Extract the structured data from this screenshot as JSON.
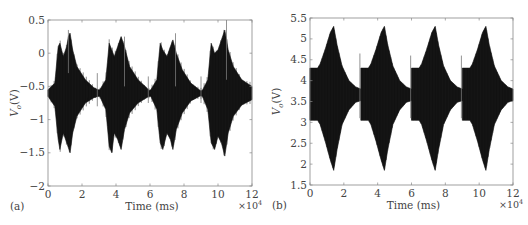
{
  "chart_data": [
    {
      "panel_label": "(a)",
      "type": "line",
      "title": "",
      "xlabel": "Time (ms)",
      "ylabel": "V_o (V)",
      "ylabel_main": "V",
      "ylabel_sub": "o",
      "ylabel_unit": "(V)",
      "x_multiplier": "×10",
      "x_multiplier_exp": "4",
      "xlim": [
        0,
        12
      ],
      "ylim": [
        -2,
        0.5
      ],
      "xticks": [
        0,
        2,
        4,
        6,
        8,
        10,
        12
      ],
      "yticks": [
        -2,
        -1.5,
        -1,
        -0.5,
        0,
        0.5
      ],
      "ytick_labels": [
        "−2",
        "−1.5",
        "−1",
        "−0.5",
        "0",
        "0.5"
      ],
      "grid": false,
      "baseline": -0.6,
      "description": "Four dense oscillation bursts with irregular jagged envelopes; baseline around -0.6 V",
      "bursts": [
        {
          "start": 0.0,
          "peak": 1.3,
          "end": 3.0,
          "max": 0.3,
          "min": -1.5
        },
        {
          "start": 3.0,
          "peak": 4.3,
          "end": 6.0,
          "max": 0.25,
          "min": -1.5
        },
        {
          "start": 6.0,
          "peak": 7.3,
          "end": 9.0,
          "max": 0.2,
          "min": -1.45
        },
        {
          "start": 9.0,
          "peak": 10.4,
          "end": 12.0,
          "max": 0.35,
          "min": -1.55
        }
      ],
      "envelope_upper": [
        [
          0,
          -0.55
        ],
        [
          0.4,
          -0.45
        ],
        [
          0.6,
          0.1
        ],
        [
          0.7,
          0.15
        ],
        [
          0.9,
          -0.05
        ],
        [
          1.1,
          0.1
        ],
        [
          1.2,
          0.25
        ],
        [
          1.3,
          0.3
        ],
        [
          1.45,
          0.05
        ],
        [
          1.7,
          -0.2
        ],
        [
          2.2,
          -0.4
        ],
        [
          2.7,
          -0.52
        ],
        [
          2.95,
          -0.55
        ],
        [
          3.05,
          -0.55
        ],
        [
          3.4,
          -0.4
        ],
        [
          3.6,
          0.15
        ],
        [
          3.75,
          0.05
        ],
        [
          3.9,
          -0.05
        ],
        [
          4.1,
          0.1
        ],
        [
          4.3,
          0.25
        ],
        [
          4.5,
          0.1
        ],
        [
          4.8,
          -0.2
        ],
        [
          5.3,
          -0.4
        ],
        [
          5.8,
          -0.52
        ],
        [
          5.95,
          -0.56
        ],
        [
          6.05,
          -0.55
        ],
        [
          6.4,
          -0.4
        ],
        [
          6.6,
          0.15
        ],
        [
          6.75,
          0.05
        ],
        [
          7.0,
          -0.05
        ],
        [
          7.2,
          0.1
        ],
        [
          7.35,
          0.2
        ],
        [
          7.55,
          0.0
        ],
        [
          7.9,
          -0.25
        ],
        [
          8.4,
          -0.45
        ],
        [
          8.9,
          -0.55
        ],
        [
          9.0,
          -0.57
        ],
        [
          9.1,
          -0.55
        ],
        [
          9.4,
          -0.4
        ],
        [
          9.6,
          0.15
        ],
        [
          9.8,
          0.0
        ],
        [
          10.0,
          0.05
        ],
        [
          10.2,
          0.2
        ],
        [
          10.4,
          0.35
        ],
        [
          10.6,
          0.05
        ],
        [
          10.9,
          -0.2
        ],
        [
          11.4,
          -0.4
        ],
        [
          12,
          -0.5
        ]
      ],
      "envelope_lower": [
        [
          0,
          -0.65
        ],
        [
          0.4,
          -0.8
        ],
        [
          0.6,
          -1.3
        ],
        [
          0.7,
          -1.45
        ],
        [
          0.9,
          -1.2
        ],
        [
          1.1,
          -1.35
        ],
        [
          1.3,
          -1.5
        ],
        [
          1.45,
          -1.2
        ],
        [
          1.7,
          -0.95
        ],
        [
          2.2,
          -0.75
        ],
        [
          2.7,
          -0.67
        ],
        [
          2.95,
          -0.65
        ],
        [
          3.05,
          -0.65
        ],
        [
          3.4,
          -0.85
        ],
        [
          3.6,
          -1.4
        ],
        [
          3.75,
          -1.5
        ],
        [
          3.9,
          -1.2
        ],
        [
          4.1,
          -1.3
        ],
        [
          4.3,
          -1.45
        ],
        [
          4.5,
          -1.15
        ],
        [
          4.8,
          -0.9
        ],
        [
          5.3,
          -0.75
        ],
        [
          5.8,
          -0.67
        ],
        [
          5.95,
          -0.65
        ],
        [
          6.05,
          -0.65
        ],
        [
          6.4,
          -0.85
        ],
        [
          6.6,
          -1.35
        ],
        [
          6.75,
          -1.45
        ],
        [
          7.0,
          -1.2
        ],
        [
          7.2,
          -1.3
        ],
        [
          7.35,
          -1.45
        ],
        [
          7.55,
          -1.15
        ],
        [
          7.9,
          -0.9
        ],
        [
          8.4,
          -0.72
        ],
        [
          8.9,
          -0.65
        ],
        [
          9.0,
          -0.64
        ],
        [
          9.1,
          -0.66
        ],
        [
          9.4,
          -0.85
        ],
        [
          9.6,
          -1.35
        ],
        [
          9.8,
          -1.45
        ],
        [
          10.0,
          -1.25
        ],
        [
          10.2,
          -1.35
        ],
        [
          10.4,
          -1.55
        ],
        [
          10.6,
          -1.2
        ],
        [
          10.9,
          -0.95
        ],
        [
          11.4,
          -0.78
        ],
        [
          12,
          -0.7
        ]
      ],
      "spikes": [
        {
          "x": 1.2,
          "y1": -0.3,
          "y2": 0.35
        },
        {
          "x": 2.9,
          "y1": -0.8,
          "y2": -0.3
        },
        {
          "x": 4.5,
          "y1": -0.5,
          "y2": 0.25
        },
        {
          "x": 5.9,
          "y1": -0.75,
          "y2": -0.35
        },
        {
          "x": 7.5,
          "y1": -0.5,
          "y2": 0.3
        },
        {
          "x": 9.0,
          "y1": -0.75,
          "y2": -0.35
        },
        {
          "x": 10.5,
          "y1": -0.4,
          "y2": 0.5
        }
      ]
    },
    {
      "panel_label": "(b)",
      "type": "line",
      "title": "",
      "xlabel": "Time (ms)",
      "ylabel": "V_o (V)",
      "ylabel_main": "V",
      "ylabel_sub": "o",
      "ylabel_unit": "(V)",
      "x_multiplier": "×10",
      "x_multiplier_exp": "4",
      "xlim": [
        0,
        12
      ],
      "ylim": [
        1.5,
        5.5
      ],
      "xticks": [
        0,
        2,
        4,
        6,
        8,
        10,
        12
      ],
      "yticks": [
        1.5,
        2,
        2.5,
        3,
        3.5,
        4,
        4.5,
        5,
        5.5
      ],
      "ytick_labels": [
        "1.5",
        "2",
        "2.5",
        "3",
        "3.5",
        "4",
        "4.5",
        "5",
        "5.5"
      ],
      "grid": false,
      "description": "Four smooth symmetric bursts peaking at ~5.3 V and ~1.85 V near t=1.4, 4.4, 7.4, 10.4 (×10^4 ms), decaying to 3.6–3.9 V band",
      "bursts": [
        {
          "start": 0.0,
          "peak": 1.4,
          "end": 3.0,
          "max": 5.3,
          "min": 1.85
        },
        {
          "start": 3.0,
          "peak": 4.4,
          "end": 6.0,
          "max": 5.3,
          "min": 1.85
        },
        {
          "start": 6.0,
          "peak": 7.4,
          "end": 9.0,
          "max": 5.3,
          "min": 1.85
        },
        {
          "start": 9.0,
          "peak": 10.4,
          "end": 12.0,
          "max": 5.3,
          "min": 1.85
        }
      ],
      "envelope_upper": [
        [
          0,
          4.3
        ],
        [
          0.45,
          4.3
        ],
        [
          0.6,
          4.4
        ],
        [
          0.9,
          4.75
        ],
        [
          1.2,
          5.15
        ],
        [
          1.4,
          5.3
        ],
        [
          1.6,
          4.85
        ],
        [
          1.9,
          4.35
        ],
        [
          2.3,
          4.0
        ],
        [
          2.7,
          3.85
        ],
        [
          3.0,
          3.8
        ],
        [
          3.0,
          4.3
        ],
        [
          3.45,
          4.3
        ],
        [
          3.6,
          4.4
        ],
        [
          3.9,
          4.75
        ],
        [
          4.2,
          5.15
        ],
        [
          4.4,
          5.3
        ],
        [
          4.6,
          4.85
        ],
        [
          4.9,
          4.35
        ],
        [
          5.3,
          4.0
        ],
        [
          5.7,
          3.85
        ],
        [
          6.0,
          3.8
        ],
        [
          6.0,
          4.3
        ],
        [
          6.45,
          4.3
        ],
        [
          6.6,
          4.4
        ],
        [
          6.9,
          4.75
        ],
        [
          7.2,
          5.15
        ],
        [
          7.4,
          5.3
        ],
        [
          7.6,
          4.85
        ],
        [
          7.9,
          4.35
        ],
        [
          8.3,
          4.0
        ],
        [
          8.7,
          3.85
        ],
        [
          9.0,
          3.8
        ],
        [
          9.0,
          4.3
        ],
        [
          9.45,
          4.3
        ],
        [
          9.6,
          4.4
        ],
        [
          9.9,
          4.75
        ],
        [
          10.2,
          5.15
        ],
        [
          10.4,
          5.3
        ],
        [
          10.6,
          4.85
        ],
        [
          10.9,
          4.35
        ],
        [
          11.3,
          4.0
        ],
        [
          11.7,
          3.85
        ],
        [
          12,
          3.8
        ]
      ],
      "envelope_lower": [
        [
          0,
          3.05
        ],
        [
          0.45,
          3.05
        ],
        [
          0.6,
          2.95
        ],
        [
          0.9,
          2.55
        ],
        [
          1.2,
          2.1
        ],
        [
          1.4,
          1.85
        ],
        [
          1.6,
          2.35
        ],
        [
          1.9,
          2.95
        ],
        [
          2.3,
          3.3
        ],
        [
          2.7,
          3.48
        ],
        [
          3.0,
          3.52
        ],
        [
          3.0,
          3.05
        ],
        [
          3.45,
          3.05
        ],
        [
          3.6,
          2.95
        ],
        [
          3.9,
          2.55
        ],
        [
          4.2,
          2.1
        ],
        [
          4.4,
          1.85
        ],
        [
          4.6,
          2.35
        ],
        [
          4.9,
          2.95
        ],
        [
          5.3,
          3.3
        ],
        [
          5.7,
          3.48
        ],
        [
          6.0,
          3.52
        ],
        [
          6.0,
          3.05
        ],
        [
          6.45,
          3.05
        ],
        [
          6.6,
          2.95
        ],
        [
          6.9,
          2.55
        ],
        [
          7.2,
          2.1
        ],
        [
          7.4,
          1.85
        ],
        [
          7.6,
          2.35
        ],
        [
          7.9,
          2.95
        ],
        [
          8.3,
          3.3
        ],
        [
          8.7,
          3.48
        ],
        [
          9.0,
          3.52
        ],
        [
          9.0,
          3.05
        ],
        [
          9.45,
          3.05
        ],
        [
          9.6,
          2.95
        ],
        [
          9.9,
          2.55
        ],
        [
          10.2,
          2.1
        ],
        [
          10.4,
          1.85
        ],
        [
          10.6,
          2.35
        ],
        [
          10.9,
          2.95
        ],
        [
          11.3,
          3.3
        ],
        [
          11.7,
          3.48
        ],
        [
          12,
          3.52
        ]
      ],
      "spikes": [
        {
          "x": 2.95,
          "y1": 3.1,
          "y2": 4.65
        },
        {
          "x": 5.95,
          "y1": 3.1,
          "y2": 4.6
        },
        {
          "x": 8.95,
          "y1": 3.1,
          "y2": 4.6
        }
      ]
    }
  ],
  "layout": {
    "panels": [
      {
        "left": 48,
        "top": 20,
        "right": 252,
        "bottom": 186
      },
      {
        "left": 310,
        "top": 18,
        "right": 513,
        "bottom": 185
      }
    ],
    "colors": {
      "signal": "#111111",
      "axis": "#888888",
      "text": "#444444",
      "background": "#ffffff"
    }
  }
}
